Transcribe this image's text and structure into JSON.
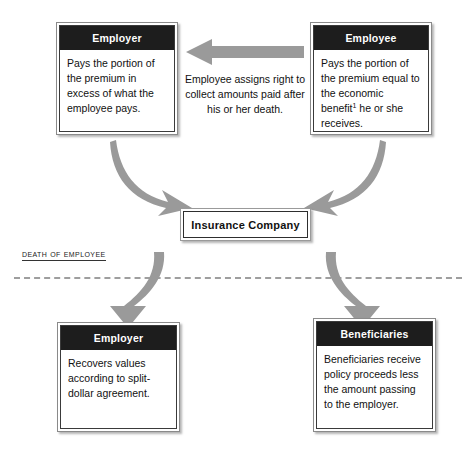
{
  "diagram": {
    "colors": {
      "header_bg": "#1d1d1d",
      "header_text": "#ffffff",
      "box_bg": "#ffffff",
      "box_border": "#3a3a3a",
      "arrow_fill": "#9a9a9a",
      "divider": "#9e9e9e",
      "page_bg": "#ffffff"
    },
    "nodes": {
      "employer_top": {
        "header": "Employer",
        "body": "Pays the portion of the premium in excess of what the employee pays."
      },
      "employee_top": {
        "header": "Employee",
        "body_before_footnote": "Pays the portion of the premium equal to the economic benefit",
        "footnote_marker": "1",
        "body_after_footnote": " he or she receives."
      },
      "insurance_company": {
        "label": "Insurance Company"
      },
      "employer_bottom": {
        "header": "Employer",
        "body": "Recovers values according to split-dollar agreement."
      },
      "beneficiaries_bottom": {
        "header": "Beneficiaries",
        "body": "Beneficiaries receive policy proceeds less the amount passing to the employer."
      }
    },
    "annotations": {
      "assignment_note": "Employee assigns right to collect amounts paid after his or her death.",
      "divider_label": "Death of Employee"
    },
    "arrows": {
      "employee_to_employer": "left-block-arrow",
      "employer_to_insurer": "curved-arrow-down-right",
      "employee_to_insurer": "curved-arrow-down-left",
      "insurer_to_employer": "curved-arrow-down-left",
      "insurer_to_beneficiaries": "curved-arrow-down-right"
    }
  }
}
